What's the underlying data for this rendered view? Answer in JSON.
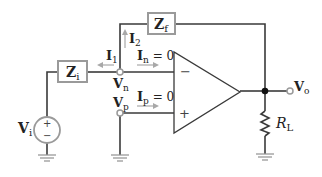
{
  "diagram": {
    "components": {
      "input_impedance": {
        "main": "Z",
        "sub": "i"
      },
      "feedback_impedance": {
        "main": "Z",
        "sub": "f"
      },
      "source": {
        "main": "V",
        "sub": "i",
        "plus": "+",
        "minus": "−"
      },
      "load": {
        "main": "R",
        "sub": "L"
      },
      "opamp": {
        "minus": "−",
        "plus": "+"
      }
    },
    "nodes": {
      "inverting": {
        "main": "V",
        "sub": "n"
      },
      "noninverting": {
        "main": "V",
        "sub": "p"
      },
      "output": {
        "main": "V",
        "sub": "o"
      }
    },
    "currents": {
      "i1": {
        "main": "I",
        "sub": "1"
      },
      "i2": {
        "main": "I",
        "sub": "2"
      },
      "in": {
        "main": "I",
        "sub": "n",
        "eq": " = 0"
      },
      "ip": {
        "main": "I",
        "sub": "p",
        "eq": " = 0"
      }
    },
    "colors": {
      "wire": "#3a3a3a",
      "component_outline": "#9a9a9a",
      "arrow": "#a8a8a8",
      "text": "#222222"
    }
  }
}
